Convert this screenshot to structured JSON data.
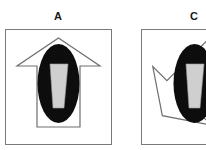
{
  "figure": {
    "background_color": "#ffffff",
    "panels": [
      {
        "id": "panel-a",
        "label": "A",
        "frame": {
          "x": 5.5,
          "y": 29.5,
          "width": 106,
          "height": 115
        },
        "frame_stroke_color": "#7a7a7a",
        "frame_stroke_width": 1,
        "arrow": {
          "name": "arrow-outline-up",
          "direction": "up",
          "rotation_deg": 0,
          "fill_color": "#ffffff",
          "stroke_color": "#6e6e6e",
          "stroke_width": 1.2,
          "points": "58.5,38 100,66 80,66 80,127 37,127 37,66 17,66"
        },
        "ellipse": {
          "name": "black-ellipse",
          "cx": 58.5,
          "cy": 83.5,
          "rx": 21,
          "ry": 39.5,
          "fill_color": "#0d0d0d"
        },
        "trapezoid": {
          "name": "gray-trapezoid",
          "fill_color": "#cfcfcf",
          "stroke_color": "#9a9a9a",
          "stroke_width": 0.6,
          "points": "50,64 68,64 64,108 53,108"
        }
      },
      {
        "id": "panel-c",
        "label": "C",
        "frame": {
          "x": 141.5,
          "y": 29.5,
          "width": 106,
          "height": 115
        },
        "frame_stroke_color": "#7a7a7a",
        "frame_stroke_width": 1,
        "arrow": {
          "name": "arrow-outline-rotated",
          "direction": "down-left",
          "rotation_deg": 225,
          "fill_color": "#ffffff",
          "stroke_color": "#6e6e6e",
          "stroke_width": 1.2,
          "points": "194.5,38 236,66 216,66 216,127 173,127 173,66 153,66"
        },
        "ellipse": {
          "name": "black-ellipse",
          "cx": 194.5,
          "cy": 83.5,
          "rx": 21,
          "ry": 39.5,
          "fill_color": "#0d0d0d"
        },
        "trapezoid": {
          "name": "gray-trapezoid",
          "fill_color": "#cfcfcf",
          "stroke_color": "#9a9a9a",
          "stroke_width": 0.6,
          "points": "186,64 204,64 200,108 189,108"
        },
        "cropped_at_right_edge": true
      }
    ]
  }
}
